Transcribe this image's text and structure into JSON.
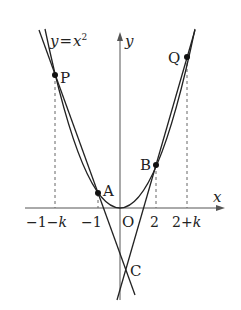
{
  "diagram": {
    "curve_label": "y = x²",
    "curve_label_parts": {
      "lhs": "y",
      "eq": "=",
      "var": "x",
      "exp": "2"
    },
    "axes": {
      "x_label": "x",
      "y_label": "y",
      "origin_label": "O"
    },
    "points": {
      "P": {
        "label": "P",
        "x": "-1-k"
      },
      "A": {
        "label": "A",
        "x": "-1"
      },
      "B": {
        "label": "B",
        "x": "2"
      },
      "Q": {
        "label": "Q",
        "x": "2+k"
      },
      "C": {
        "label": "C"
      }
    },
    "x_ticks": [
      {
        "minus": "−1−",
        "k": "k"
      },
      {
        "text": "−1"
      },
      {
        "text": "2"
      },
      {
        "plus": "2+",
        "k": "k"
      }
    ],
    "lines": [
      "line PC (through P and A)",
      "line QC (through Q and B)"
    ],
    "colors": {
      "ink": "#222222",
      "axis": "#555555",
      "dash": "#666666"
    }
  }
}
